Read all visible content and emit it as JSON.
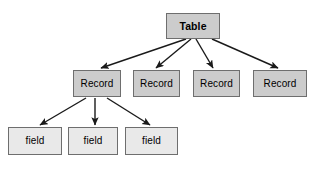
{
  "diagram": {
    "type": "tree",
    "background_color": "#ffffff",
    "node_fill_dark": "#cccccc",
    "node_fill_light": "#e9e9e9",
    "node_border_color": "#6e6e6e",
    "edge_color": "#1a1a1a",
    "levels": [
      {
        "name": "table-level",
        "label": "Table"
      },
      {
        "name": "record-level",
        "label": "Record"
      },
      {
        "name": "field-level",
        "label": "field"
      }
    ],
    "nodes": {
      "table": {
        "label": "Table",
        "x": 166,
        "y": 13,
        "w": 54,
        "h": 26,
        "fill": "#cccccc",
        "bold": true
      },
      "records": [
        {
          "label": "Record",
          "x": 73,
          "y": 70,
          "w": 48,
          "h": 27,
          "fill": "#cccccc"
        },
        {
          "label": "Record",
          "x": 133,
          "y": 70,
          "w": 47,
          "h": 27,
          "fill": "#cccccc"
        },
        {
          "label": "Record",
          "x": 193,
          "y": 70,
          "w": 47,
          "h": 27,
          "fill": "#cccccc"
        },
        {
          "label": "Record",
          "x": 253,
          "y": 70,
          "w": 54,
          "h": 27,
          "fill": "#cccccc"
        }
      ],
      "fields": [
        {
          "label": "field",
          "x": 8,
          "y": 127,
          "w": 54,
          "h": 28,
          "fill": "#e9e9e9"
        },
        {
          "label": "field",
          "x": 68,
          "y": 127,
          "w": 50,
          "h": 28,
          "fill": "#e9e9e9"
        },
        {
          "label": "field",
          "x": 125,
          "y": 127,
          "w": 53,
          "h": 28,
          "fill": "#e9e9e9"
        }
      ]
    },
    "edges": [
      {
        "name": "table-to-record-1",
        "from": "table",
        "to": "record-1",
        "x1": 186,
        "y1": 39,
        "x2": 101,
        "y2": 68
      },
      {
        "name": "table-to-record-2",
        "from": "table",
        "to": "record-2",
        "x1": 191,
        "y1": 39,
        "x2": 156,
        "y2": 68
      },
      {
        "name": "table-to-record-3",
        "from": "table",
        "to": "record-3",
        "x1": 196,
        "y1": 39,
        "x2": 213,
        "y2": 68
      },
      {
        "name": "table-to-record-4",
        "from": "table",
        "to": "record-4",
        "x1": 212,
        "y1": 39,
        "x2": 278,
        "y2": 68
      },
      {
        "name": "record-to-field-1",
        "from": "record-1",
        "to": "field-1",
        "x1": 86,
        "y1": 98,
        "x2": 40,
        "y2": 125
      },
      {
        "name": "record-to-field-2",
        "from": "record-1",
        "to": "field-2",
        "x1": 95,
        "y1": 98,
        "x2": 95,
        "y2": 125
      },
      {
        "name": "record-to-field-3",
        "from": "record-1",
        "to": "field-3",
        "x1": 107,
        "y1": 98,
        "x2": 150,
        "y2": 125
      }
    ]
  }
}
